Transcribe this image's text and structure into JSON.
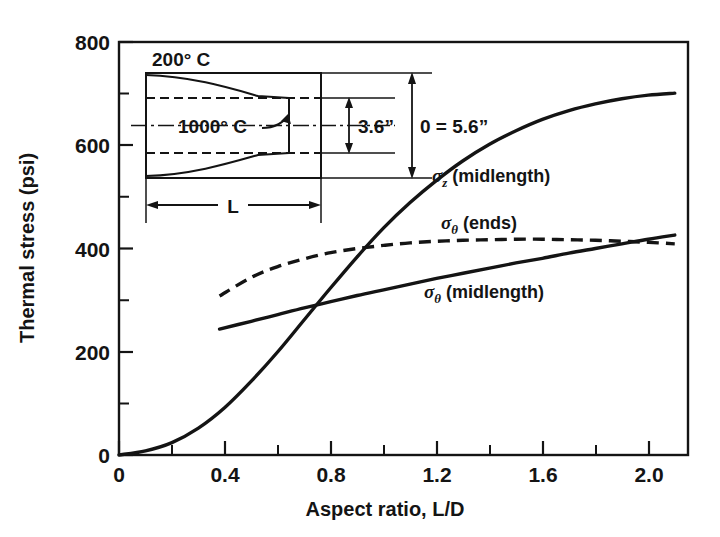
{
  "chart_data": {
    "type": "line",
    "title": "",
    "xlabel": "Aspect ratio, L/D",
    "ylabel": "Thermal stress (psi)",
    "xlim": [
      0,
      2.15
    ],
    "ylim": [
      0,
      800
    ],
    "xticks": [
      0,
      0.4,
      0.8,
      1.2,
      1.6,
      2.0
    ],
    "xtick_labels": [
      "0",
      "0.4",
      "0.8",
      "1.2",
      "1.6",
      "2.0"
    ],
    "xminor_step": 0.2,
    "yticks": [
      0,
      200,
      400,
      600,
      800
    ],
    "ytick_labels": [
      "0",
      "200",
      "400",
      "600",
      "800"
    ],
    "yminor_step": 100,
    "grid": false,
    "legend_position": "inline-curve-labels",
    "series": [
      {
        "name": "sigma_z (midlength)",
        "label_text": " (midlength)",
        "label_symbol": "σ",
        "label_subscript": "z",
        "style": "solid",
        "x": [
          0.0,
          0.1,
          0.2,
          0.3,
          0.4,
          0.5,
          0.6,
          0.7,
          0.8,
          0.9,
          1.0,
          1.1,
          1.2,
          1.3,
          1.4,
          1.5,
          1.6,
          1.7,
          1.8,
          1.9,
          2.0,
          2.1
        ],
        "y": [
          0,
          8,
          24,
          52,
          92,
          143,
          200,
          262,
          324,
          384,
          440,
          489,
          532,
          570,
          602,
          628,
          650,
          667,
          680,
          690,
          697,
          701
        ]
      },
      {
        "name": "sigma_theta (ends)",
        "label_text": " (ends)",
        "label_symbol": "σ",
        "label_subscript": "θ",
        "style": "dashed",
        "x": [
          0.38,
          0.5,
          0.6,
          0.7,
          0.8,
          0.9,
          1.0,
          1.1,
          1.2,
          1.3,
          1.4,
          1.5,
          1.6,
          1.7,
          1.8,
          1.9,
          2.0,
          2.1
        ],
        "y": [
          308,
          344,
          365,
          380,
          392,
          400,
          406,
          411,
          414,
          416,
          417,
          418,
          418,
          417,
          416,
          414,
          412,
          409
        ]
      },
      {
        "name": "sigma_theta (midlength)",
        "label_text": " (midlength)",
        "label_symbol": "σ",
        "label_subscript": "θ",
        "style": "solid",
        "x": [
          0.38,
          0.5,
          0.6,
          0.7,
          0.8,
          0.9,
          1.0,
          1.1,
          1.2,
          1.3,
          1.4,
          1.5,
          1.6,
          1.7,
          1.8,
          1.9,
          2.0,
          2.1
        ],
        "y": [
          244,
          259,
          272,
          285,
          297,
          309,
          320,
          331,
          342,
          352,
          362,
          372,
          381,
          391,
          400,
          409,
          418,
          426
        ]
      }
    ],
    "curve_labels": [
      {
        "id": "sigma-z-midlength",
        "symbol": "σ",
        "subscript": "z",
        "text": " (midlength)",
        "x": 432,
        "y": 182
      },
      {
        "id": "sigma-theta-ends",
        "symbol": "σ",
        "subscript": "θ",
        "text": " (ends)",
        "x": 441,
        "y": 229
      },
      {
        "id": "sigma-theta-midlength",
        "symbol": "σ",
        "subscript": "θ",
        "text": " (midlength)",
        "x": 424,
        "y": 298
      }
    ],
    "inset": {
      "outer_temperature_label": "200° C",
      "inner_temperature_label": "1000° C",
      "inner_diameter_label": "3.6”",
      "outer_diameter_label": "0 = 5.6”",
      "length_label": "L"
    }
  },
  "colors": {
    "background": "#ffffff",
    "ink": "#141414",
    "curve": "#141414"
  }
}
